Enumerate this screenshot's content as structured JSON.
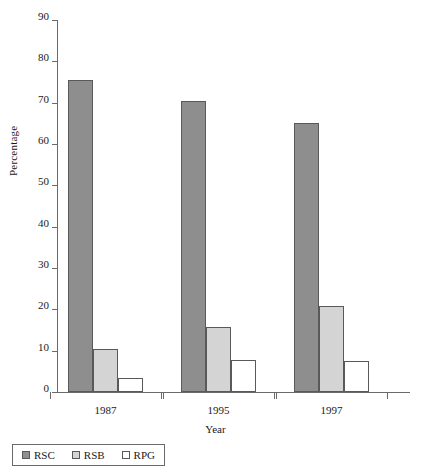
{
  "chart_data": {
    "type": "bar",
    "title": "",
    "xlabel": "Year",
    "ylabel": "Percentage",
    "categories": [
      "1987",
      "1995",
      "1997"
    ],
    "series": [
      {
        "name": "RSC",
        "values": [
          75.5,
          70.5,
          65.1
        ],
        "color": "#8e8e8e"
      },
      {
        "name": "RSB",
        "values": [
          10.3,
          15.7,
          20.8
        ],
        "color": "#d4d4d4"
      },
      {
        "name": "RPG",
        "values": [
          3.3,
          7.7,
          7.5
        ],
        "color": "#ffffff"
      }
    ],
    "ylim": [
      0,
      90
    ],
    "yticks": [
      0,
      10,
      20,
      30,
      40,
      50,
      60,
      70,
      80,
      90
    ],
    "ytick_labels": [
      "0",
      "10",
      "20",
      "30",
      "40",
      "50",
      "60",
      "70",
      "80",
      "90"
    ],
    "grid": false,
    "legend_position": "bottom-left",
    "bar_border_color": "#595959",
    "axis_color": "#6a6a6a"
  },
  "legend": {
    "items": [
      {
        "label": "RSC",
        "color": "#8e8e8e"
      },
      {
        "label": "RSB",
        "color": "#d4d4d4"
      },
      {
        "label": "RPG",
        "color": "#ffffff"
      }
    ]
  }
}
